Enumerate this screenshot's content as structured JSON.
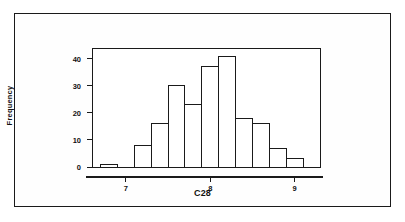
{
  "chart_data": {
    "type": "bar",
    "title": "",
    "subtitle": "",
    "xlabel": "C28",
    "ylabel": "Frequency",
    "xlim": [
      6.6,
      9.3
    ],
    "ylim": [
      0,
      44
    ],
    "grid": false,
    "legend": false,
    "bin_width": 0.2,
    "categories": [
      "6.7",
      "6.9",
      "7.1",
      "7.3",
      "7.5",
      "7.7",
      "7.9",
      "8.1",
      "8.3",
      "8.5",
      "8.7",
      "8.9"
    ],
    "bin_starts": [
      6.7,
      6.9,
      7.1,
      7.3,
      7.5,
      7.7,
      7.9,
      8.1,
      8.3,
      8.5,
      8.7,
      8.9
    ],
    "values": [
      1,
      0,
      8,
      16,
      30,
      23,
      37,
      41,
      18,
      16,
      7,
      3
    ],
    "yticks": [
      0,
      10,
      20,
      30,
      40
    ],
    "ytick_labels": [
      "0",
      "10",
      "20",
      "30",
      "40"
    ],
    "xticks": [
      7,
      8,
      9
    ],
    "xtick_labels": [
      "7",
      "8",
      "9"
    ],
    "bar_fill": "#ffffff",
    "bar_stroke": "#1a1a1a",
    "axis_color": "#1a1a1a",
    "background": "#ffffff"
  },
  "frame": {
    "border_color": "#1a1a1a"
  }
}
